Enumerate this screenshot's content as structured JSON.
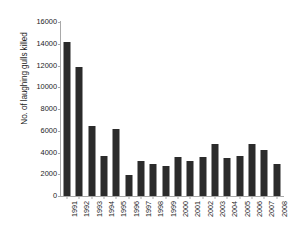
{
  "chart_data": {
    "type": "bar",
    "title": "",
    "xlabel": "",
    "ylabel": "No. of laughing gulls killed",
    "ylim": [
      0,
      16000
    ],
    "ytick_step": 2000,
    "yticks": [
      0,
      2000,
      4000,
      6000,
      8000,
      10000,
      12000,
      14000,
      16000
    ],
    "ytick_labels": [
      "0",
      "2000",
      "4000",
      "6000",
      "8000",
      "10000",
      "12000",
      "14000",
      "16000"
    ],
    "grid": false,
    "legend": false,
    "bar_color": "#2b2b2b",
    "axis_color": "#a9a9a9",
    "categories": [
      "1991",
      "1992",
      "1993",
      "1994",
      "1995",
      "1996",
      "1997",
      "1998",
      "1999",
      "2000",
      "2001",
      "2002",
      "2003",
      "2004",
      "2005",
      "2006",
      "2007",
      "2008"
    ],
    "values": [
      14200,
      11850,
      6450,
      3650,
      6150,
      1950,
      3200,
      2900,
      2800,
      3550,
      3200,
      3600,
      4800,
      3450,
      3650,
      4800,
      4250,
      2900
    ]
  }
}
